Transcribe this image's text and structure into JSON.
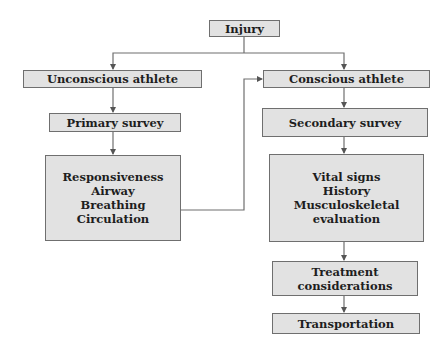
{
  "diagram": {
    "type": "flowchart",
    "colors": {
      "box_fill": "#e2e2e2",
      "box_border": "#6f6f6f",
      "line": "#6f6f6f",
      "text": "#1e1e1e"
    },
    "nodes": {
      "injury": {
        "lines": [
          "Injury"
        ]
      },
      "unconscious": {
        "lines": [
          "Unconscious athlete"
        ]
      },
      "conscious": {
        "lines": [
          "Conscious athlete"
        ]
      },
      "primary": {
        "lines": [
          "Primary survey"
        ]
      },
      "secondary": {
        "lines": [
          "Secondary survey"
        ]
      },
      "abc": {
        "lines": [
          "Responsiveness",
          "Airway",
          "Breathing",
          "Circulation"
        ]
      },
      "vitals": {
        "lines": [
          "Vital signs",
          "History",
          "Musculoskeletal",
          "evaluation"
        ]
      },
      "treatment": {
        "lines": [
          "Treatment",
          "considerations"
        ]
      },
      "transport": {
        "lines": [
          "Transportation"
        ]
      }
    },
    "edges": [
      {
        "from": "injury",
        "to": "unconscious"
      },
      {
        "from": "injury",
        "to": "conscious"
      },
      {
        "from": "unconscious",
        "to": "primary"
      },
      {
        "from": "primary",
        "to": "abc"
      },
      {
        "from": "abc",
        "to": "conscious"
      },
      {
        "from": "conscious",
        "to": "secondary"
      },
      {
        "from": "secondary",
        "to": "vitals"
      },
      {
        "from": "vitals",
        "to": "treatment"
      },
      {
        "from": "treatment",
        "to": "transport"
      }
    ]
  }
}
